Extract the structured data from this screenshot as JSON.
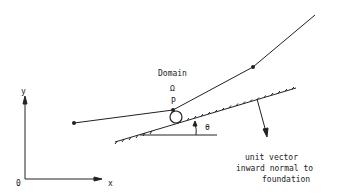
{
  "labels": {
    "domain": "Domain",
    "omega": "Ω",
    "point": "P",
    "theta": "θ",
    "y_axis": "y",
    "x_axis": "x",
    "origin": "0",
    "normal_line1": "unit vector",
    "normal_line2": "inward normal to",
    "normal_line3": "foundation"
  },
  "colors": {
    "ink": "#222222",
    "background": "#ffffff"
  }
}
